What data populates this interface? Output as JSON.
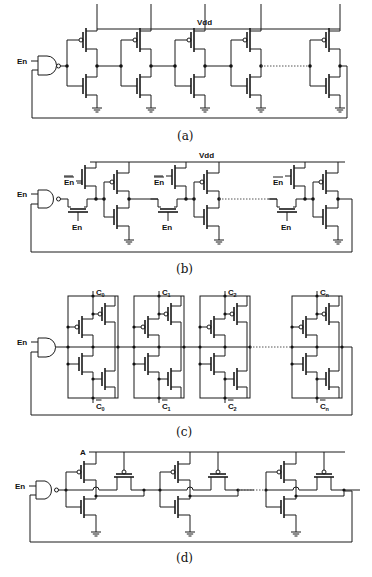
{
  "figure": {
    "panels": [
      {
        "id": "a",
        "caption": "(a)",
        "description": "Ring oscillator with NAND enable gate and chain of CMOS inverters",
        "labels": {
          "supply": "Vdd",
          "enable": "En"
        },
        "stages_drawn": 4,
        "stages_ellipsis": true
      },
      {
        "id": "b",
        "caption": "(b)",
        "description": "Ring oscillator with enable-controlled transmission/pass transistors between inverter stages",
        "labels": {
          "supply": "Vdd",
          "enable": "En",
          "enable_bar": "En",
          "gate_label": "En"
        },
        "stages_drawn": 3,
        "stages_ellipsis": true
      },
      {
        "id": "c",
        "caption": "(c)",
        "description": "Ring oscillator with current-starved / controlled inverter stages C0..Cn",
        "labels": {
          "enable": "En",
          "controls_top": [
            "C0",
            "C1",
            "C2",
            "Cn"
          ],
          "controls_bottom": [
            "C0",
            "C1",
            "C2",
            "Cn"
          ],
          "c_base": "C",
          "subscripts": [
            "0",
            "1",
            "2",
            "n"
          ]
        },
        "stages_drawn": 4,
        "stages_ellipsis": true
      },
      {
        "id": "d",
        "caption": "(d)",
        "description": "Ring oscillator with PMOS feed-forward transistors gated by node A",
        "labels": {
          "node": "A",
          "enable": "En"
        },
        "stages_drawn": 3,
        "stages_ellipsis": true
      }
    ]
  }
}
